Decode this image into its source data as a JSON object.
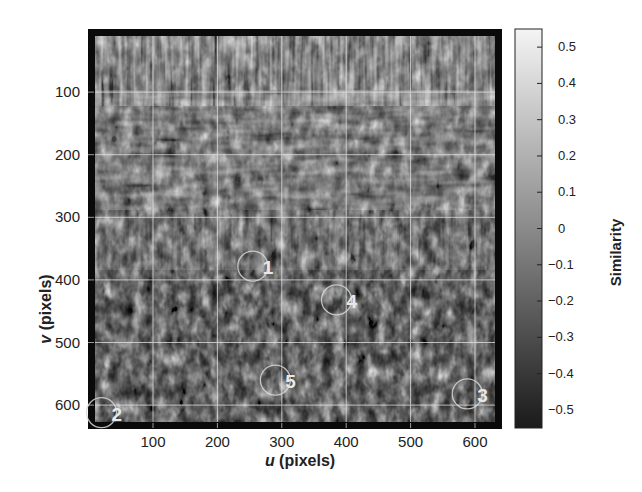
{
  "chart_data": {
    "type": "heatmap",
    "title": "",
    "xlabel_var": "u",
    "xlabel_unit": "(pixels)",
    "ylabel_var": "v",
    "ylabel_unit": "(pixels)",
    "xlim": [
      0,
      640
    ],
    "ylim": [
      640,
      0
    ],
    "x_ticks": [
      100,
      200,
      300,
      400,
      500,
      600
    ],
    "y_ticks": [
      100,
      200,
      300,
      400,
      500,
      600
    ],
    "grid": true,
    "colormap": "gray",
    "colorbar": {
      "label": "Similarity",
      "range": [
        -0.55,
        0.55
      ],
      "ticks": [
        "0.5",
        "0.4",
        "0.3",
        "0.2",
        "0.1",
        "0",
        "−0.1",
        "−0.2",
        "−0.3",
        "−0.4",
        "−0.5"
      ]
    },
    "annotations": [
      {
        "label": "1",
        "u": 255,
        "v": 378,
        "shape": "circle"
      },
      {
        "label": "2",
        "u": 20,
        "v": 612,
        "shape": "circle"
      },
      {
        "label": "3",
        "u": 588,
        "v": 582,
        "shape": "circle"
      },
      {
        "label": "4",
        "u": 385,
        "v": 432,
        "shape": "circle"
      },
      {
        "label": "5",
        "u": 290,
        "v": 560,
        "shape": "circle"
      }
    ]
  },
  "axes": {
    "x_tick_labels": [
      "100",
      "200",
      "300",
      "400",
      "500",
      "600"
    ],
    "y_tick_labels": [
      "100",
      "200",
      "300",
      "400",
      "500",
      "600"
    ]
  }
}
